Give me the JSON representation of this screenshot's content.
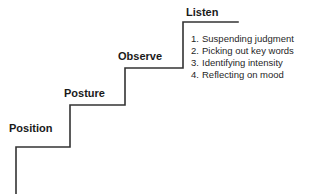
{
  "diagram": {
    "line_color": "#333333",
    "text_color": "#1a1a1a",
    "background": "#ffffff",
    "steps": [
      {
        "label": "Position"
      },
      {
        "label": "Posture"
      },
      {
        "label": "Observe"
      },
      {
        "label": "Listen"
      }
    ],
    "listen_details": [
      {
        "number": "1.",
        "text": "Suspending judgment"
      },
      {
        "number": "2.",
        "text": "Picking out key words"
      },
      {
        "number": "3.",
        "text": "Identifying intensity"
      },
      {
        "number": "4.",
        "text": "Reflecting on mood"
      }
    ]
  }
}
